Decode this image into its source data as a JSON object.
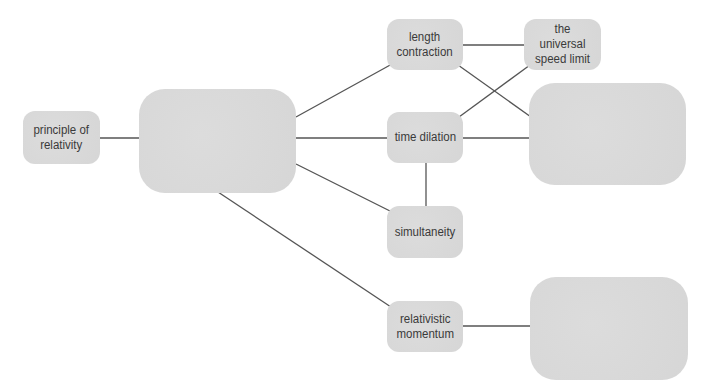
{
  "diagram": {
    "type": "concept-map",
    "top_caption_clipped": "",
    "edge_color": "#555555",
    "node_color": "#d9d9d9",
    "text_color": "#3a3a3a",
    "nodes": [
      {
        "id": "principle",
        "label": "principle of\nrelativity",
        "x": 23,
        "y": 111,
        "w": 77,
        "h": 53,
        "size": "small"
      },
      {
        "id": "center",
        "label": "",
        "x": 139,
        "y": 89,
        "w": 157,
        "h": 104,
        "size": "large"
      },
      {
        "id": "length",
        "label": "length\ncontraction",
        "x": 387,
        "y": 19,
        "w": 76,
        "h": 51,
        "size": "small"
      },
      {
        "id": "speed",
        "label": "the universal\nspeed limit",
        "x": 524,
        "y": 19,
        "w": 77,
        "h": 51,
        "size": "small"
      },
      {
        "id": "time",
        "label": "time dilation",
        "x": 387,
        "y": 112,
        "w": 76,
        "h": 51,
        "size": "small"
      },
      {
        "id": "right_upper",
        "label": "",
        "x": 529,
        "y": 83,
        "w": 157,
        "h": 102,
        "size": "large"
      },
      {
        "id": "simult",
        "label": "simultaneity",
        "x": 387,
        "y": 206,
        "w": 76,
        "h": 52,
        "size": "small"
      },
      {
        "id": "momentum",
        "label": "relativistic\nmomentum",
        "x": 387,
        "y": 301,
        "w": 76,
        "h": 51,
        "size": "small"
      },
      {
        "id": "right_lower",
        "label": "",
        "x": 530,
        "y": 277,
        "w": 158,
        "h": 103,
        "size": "large"
      }
    ],
    "edges": [
      {
        "from": "principle",
        "to": "center",
        "x1": 100,
        "y1": 138,
        "x2": 139,
        "y2": 138
      },
      {
        "from": "center",
        "to": "length",
        "x1": 296,
        "y1": 117,
        "x2": 392,
        "y2": 64
      },
      {
        "from": "center",
        "to": "time",
        "x1": 296,
        "y1": 138,
        "x2": 387,
        "y2": 138
      },
      {
        "from": "center",
        "to": "simult",
        "x1": 296,
        "y1": 164,
        "x2": 392,
        "y2": 212
      },
      {
        "from": "center",
        "to": "momentum",
        "x1": 218,
        "y1": 192,
        "x2": 391,
        "y2": 307
      },
      {
        "from": "length",
        "to": "speed",
        "x1": 463,
        "y1": 45,
        "x2": 524,
        "y2": 45
      },
      {
        "from": "length",
        "to": "right_upper",
        "x1": 458,
        "y1": 65,
        "x2": 531,
        "y2": 117
      },
      {
        "from": "time",
        "to": "speed",
        "x1": 459,
        "y1": 117,
        "x2": 530,
        "y2": 65
      },
      {
        "from": "time",
        "to": "right_upper",
        "x1": 463,
        "y1": 138,
        "x2": 529,
        "y2": 138
      },
      {
        "from": "time",
        "to": "simult",
        "x1": 426,
        "y1": 163,
        "x2": 426,
        "y2": 206
      },
      {
        "from": "momentum",
        "to": "right_lower",
        "x1": 463,
        "y1": 326,
        "x2": 530,
        "y2": 326
      }
    ]
  }
}
